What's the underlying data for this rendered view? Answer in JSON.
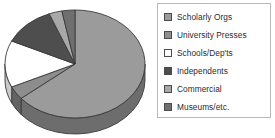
{
  "chart_data": {
    "type": "pie",
    "title": "",
    "subtitle": "",
    "xlabel": "",
    "ylabel": "",
    "grid": false,
    "legend_position": "right",
    "three_d": true,
    "start_angle_deg": -90,
    "direction": "clockwise",
    "categories": [
      "Scholarly Orgs",
      "University Presses",
      "Schools/Dep'ts",
      "Independents",
      "Commercial",
      "Museums/etc."
    ],
    "values": [
      64,
      4,
      14,
      12,
      3,
      3
    ],
    "units": "percent",
    "colors": [
      "#9b9b9b",
      "#8d8d8d",
      "#ffffff",
      "#4e4e4e",
      "#a8a8a8",
      "#6f6f6f"
    ],
    "side_colors": [
      "#6d6d6d",
      "#636363",
      "#c9c9c9",
      "#383838",
      "#777777",
      "#4f4f4f"
    ],
    "outline_color": "#3a3a3a",
    "slices": [
      {
        "label": "Scholarly Orgs",
        "value": 64,
        "color": "#9b9b9b"
      },
      {
        "label": "University Presses",
        "value": 4,
        "color": "#8d8d8d"
      },
      {
        "label": "Schools/Dep'ts",
        "value": 14,
        "color": "#ffffff"
      },
      {
        "label": "Independents",
        "value": 12,
        "color": "#4e4e4e"
      },
      {
        "label": "Commercial",
        "value": 3,
        "color": "#a8a8a8"
      },
      {
        "label": "Museums/etc.",
        "value": 3,
        "color": "#6f6f6f"
      }
    ]
  },
  "legend": {
    "border_color": "#b9b9b9",
    "background": "#ffffff",
    "items": [
      {
        "label": "Scholarly Orgs",
        "swatch": "#9b9b9b",
        "icon": "legend-swatch-icon"
      },
      {
        "label": "University Presses",
        "swatch": "#8d8d8d",
        "icon": "legend-swatch-icon"
      },
      {
        "label": "Schools/Dep'ts",
        "swatch": "#ffffff",
        "icon": "legend-swatch-icon"
      },
      {
        "label": "Independents",
        "swatch": "#4e4e4e",
        "icon": "legend-swatch-icon"
      },
      {
        "label": "Commercial",
        "swatch": "#a8a8a8",
        "icon": "legend-swatch-icon"
      },
      {
        "label": "Museums/etc.",
        "swatch": "#6f6f6f",
        "icon": "legend-swatch-icon"
      }
    ]
  }
}
